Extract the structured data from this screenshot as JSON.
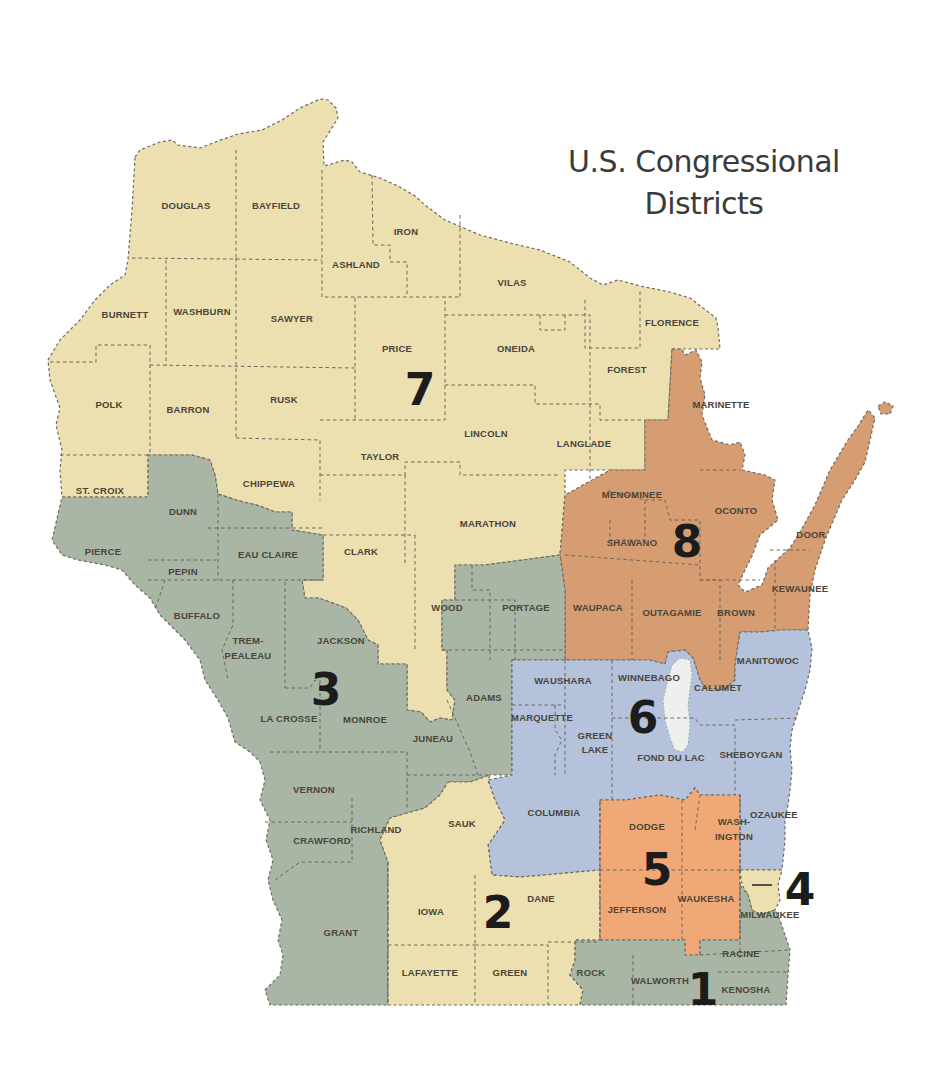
{
  "title": {
    "line1": "U.S. Congressional",
    "line2": "Districts"
  },
  "colors": {
    "district_1": "#a9b5a5",
    "district_2": "#ece0b0",
    "district_3": "#a9b5a5",
    "district_4": "#ece0b0",
    "district_5": "#f1a877",
    "district_6": "#b5c2db",
    "district_7": "#ece0b0",
    "district_8": "#d69c72",
    "lake": "#eef0ee",
    "background": "#ffffff"
  },
  "districts": [
    {
      "number": "1",
      "counties": [
        "RACINE",
        "KENOSHA",
        "WALWORTH",
        "ROCK (part)",
        "MILWAUKEE (part)"
      ]
    },
    {
      "number": "2",
      "counties": [
        "DANE",
        "IOWA",
        "LAFAYETTE",
        "GREEN",
        "SAUK",
        "ROCK (part)"
      ]
    },
    {
      "number": "3",
      "counties": [
        "PIERCE",
        "DUNN",
        "PEPIN",
        "EAU CLAIRE",
        "BUFFALO",
        "TREMPEALEAU",
        "JACKSON",
        "LA CROSSE",
        "MONROE",
        "VERNON",
        "CRAWFORD",
        "RICHLAND",
        "GRANT",
        "JUNEAU",
        "ADAMS",
        "PORTAGE",
        "WOOD (part)"
      ]
    },
    {
      "number": "4",
      "counties": [
        "MILWAUKEE"
      ]
    },
    {
      "number": "5",
      "counties": [
        "DODGE",
        "WASHINGTON",
        "JEFFERSON",
        "WAUKESHA"
      ]
    },
    {
      "number": "6",
      "counties": [
        "WAUSHARA",
        "WINNEBAGO",
        "CALUMET (part)",
        "MARQUETTE",
        "GREEN LAKE",
        "FOND DU LAC",
        "SHEBOYGAN",
        "MANITOWOC",
        "OZAUKEE",
        "COLUMBIA"
      ]
    },
    {
      "number": "7",
      "counties": [
        "DOUGLAS",
        "BAYFIELD",
        "ASHLAND",
        "IRON",
        "VILAS",
        "BURNETT",
        "WASHBURN",
        "SAWYER",
        "PRICE",
        "ONEIDA",
        "FLORENCE",
        "FOREST",
        "POLK",
        "BARRON",
        "RUSK",
        "LINCOLN",
        "LANGLADE",
        "TAYLOR",
        "ST. CROIX",
        "CHIPPEWA",
        "CLARK",
        "MARATHON",
        "WOOD"
      ]
    },
    {
      "number": "8",
      "counties": [
        "MARINETTE",
        "MENOMINEE",
        "OCONTO",
        "SHAWANO",
        "DOOR",
        "WAUPACA",
        "OUTAGAMIE",
        "BROWN",
        "KEWAUNEE",
        "CALUMET"
      ]
    }
  ],
  "district_labels": [
    {
      "number": "1",
      "x": 703,
      "y": 1005
    },
    {
      "number": "2",
      "x": 498,
      "y": 928
    },
    {
      "number": "3",
      "x": 326,
      "y": 705
    },
    {
      "number": "4",
      "x": 800,
      "y": 905
    },
    {
      "number": "5",
      "x": 657,
      "y": 885
    },
    {
      "number": "6",
      "x": 643,
      "y": 733
    },
    {
      "number": "7",
      "x": 420,
      "y": 405
    },
    {
      "number": "8",
      "x": 687,
      "y": 557
    }
  ],
  "county_labels": [
    {
      "name": "DOUGLAS",
      "x": 186,
      "y": 209
    },
    {
      "name": "BAYFIELD",
      "x": 276,
      "y": 209
    },
    {
      "name": "IRON",
      "x": 406,
      "y": 235
    },
    {
      "name": "ASHLAND",
      "x": 356,
      "y": 268
    },
    {
      "name": "VILAS",
      "x": 512,
      "y": 286
    },
    {
      "name": "BURNETT",
      "x": 125,
      "y": 318
    },
    {
      "name": "WASHBURN",
      "x": 202,
      "y": 315
    },
    {
      "name": "SAWYER",
      "x": 292,
      "y": 322
    },
    {
      "name": "FLORENCE",
      "x": 672,
      "y": 326
    },
    {
      "name": "PRICE",
      "x": 397,
      "y": 352
    },
    {
      "name": "ONEIDA",
      "x": 516,
      "y": 352
    },
    {
      "name": "FOREST",
      "x": 627,
      "y": 373
    },
    {
      "name": "POLK",
      "x": 109,
      "y": 408
    },
    {
      "name": "BARRON",
      "x": 188,
      "y": 413
    },
    {
      "name": "RUSK",
      "x": 284,
      "y": 403
    },
    {
      "name": "MARINETTE",
      "x": 721,
      "y": 408
    },
    {
      "name": "LINCOLN",
      "x": 486,
      "y": 437
    },
    {
      "name": "LANGLADE",
      "x": 584,
      "y": 447
    },
    {
      "name": "TAYLOR",
      "x": 380,
      "y": 460
    },
    {
      "name": "CHIPPEWA",
      "x": 269,
      "y": 487
    },
    {
      "name": "ST. CROIX",
      "x": 100,
      "y": 494
    },
    {
      "name": "MENOMINEE",
      "x": 632,
      "y": 498
    },
    {
      "name": "MARATHON",
      "x": 488,
      "y": 527
    },
    {
      "name": "OCONTO",
      "x": 736,
      "y": 514
    },
    {
      "name": "DUNN",
      "x": 183,
      "y": 515
    },
    {
      "name": "SHAWANO",
      "x": 632,
      "y": 546
    },
    {
      "name": "DOOR",
      "x": 811,
      "y": 538
    },
    {
      "name": "PIERCE",
      "x": 103,
      "y": 555
    },
    {
      "name": "EAU CLAIRE",
      "x": 268,
      "y": 558
    },
    {
      "name": "CLARK",
      "x": 361,
      "y": 555
    },
    {
      "name": "PEPIN",
      "x": 183,
      "y": 575
    },
    {
      "name": "KEWAUNEE",
      "x": 800,
      "y": 592
    },
    {
      "name": "WOOD",
      "x": 447,
      "y": 611
    },
    {
      "name": "PORTAGE",
      "x": 526,
      "y": 611
    },
    {
      "name": "WAUPACA",
      "x": 598,
      "y": 611
    },
    {
      "name": "OUTAGAMIE",
      "x": 672,
      "y": 616
    },
    {
      "name": "BROWN",
      "x": 736,
      "y": 616
    },
    {
      "name": "BUFFALO",
      "x": 197,
      "y": 619
    },
    {
      "name": "TREM-",
      "x": 248,
      "y": 644
    },
    {
      "name": "PEALEAU",
      "x": 248,
      "y": 659
    },
    {
      "name": "JACKSON",
      "x": 341,
      "y": 644
    },
    {
      "name": "MANITOWOC",
      "x": 768,
      "y": 664
    },
    {
      "name": "WINNEBAGO",
      "x": 649,
      "y": 681
    },
    {
      "name": "WAUSHARA",
      "x": 563,
      "y": 684
    },
    {
      "name": "CALUMET",
      "x": 718,
      "y": 691
    },
    {
      "name": "ADAMS",
      "x": 484,
      "y": 701
    },
    {
      "name": "LA CROSSE",
      "x": 289,
      "y": 722
    },
    {
      "name": "MONROE",
      "x": 365,
      "y": 723
    },
    {
      "name": "MARQUETTE",
      "x": 542,
      "y": 721
    },
    {
      "name": "GREEN",
      "x": 595,
      "y": 739
    },
    {
      "name": "LAKE",
      "x": 595,
      "y": 753
    },
    {
      "name": "JUNEAU",
      "x": 433,
      "y": 742
    },
    {
      "name": "FOND DU LAC",
      "x": 671,
      "y": 761
    },
    {
      "name": "SHEBOYGAN",
      "x": 751,
      "y": 758
    },
    {
      "name": "VERNON",
      "x": 314,
      "y": 793
    },
    {
      "name": "COLUMBIA",
      "x": 554,
      "y": 816
    },
    {
      "name": "OZAUKEE",
      "x": 774,
      "y": 818
    },
    {
      "name": "DODGE",
      "x": 647,
      "y": 830
    },
    {
      "name": "WASH-",
      "x": 734,
      "y": 825
    },
    {
      "name": "INGTON",
      "x": 734,
      "y": 840
    },
    {
      "name": "SAUK",
      "x": 462,
      "y": 827
    },
    {
      "name": "RICHLAND",
      "x": 376,
      "y": 833
    },
    {
      "name": "CRAWFORD",
      "x": 322,
      "y": 844
    },
    {
      "name": "DANE",
      "x": 541,
      "y": 902
    },
    {
      "name": "WAUKESHA",
      "x": 706,
      "y": 902
    },
    {
      "name": "IOWA",
      "x": 431,
      "y": 915
    },
    {
      "name": "JEFFERSON",
      "x": 637,
      "y": 913
    },
    {
      "name": "MILWAUKEE",
      "x": 770,
      "y": 918
    },
    {
      "name": "GRANT",
      "x": 341,
      "y": 936
    },
    {
      "name": "RACINE",
      "x": 741,
      "y": 957
    },
    {
      "name": "LAFAYETTE",
      "x": 430,
      "y": 976
    },
    {
      "name": "GREEN",
      "x": 510,
      "y": 976
    },
    {
      "name": "ROCK",
      "x": 591,
      "y": 976
    },
    {
      "name": "WALWORTH",
      "x": 660,
      "y": 984
    },
    {
      "name": "KENOSHA",
      "x": 746,
      "y": 993
    }
  ]
}
